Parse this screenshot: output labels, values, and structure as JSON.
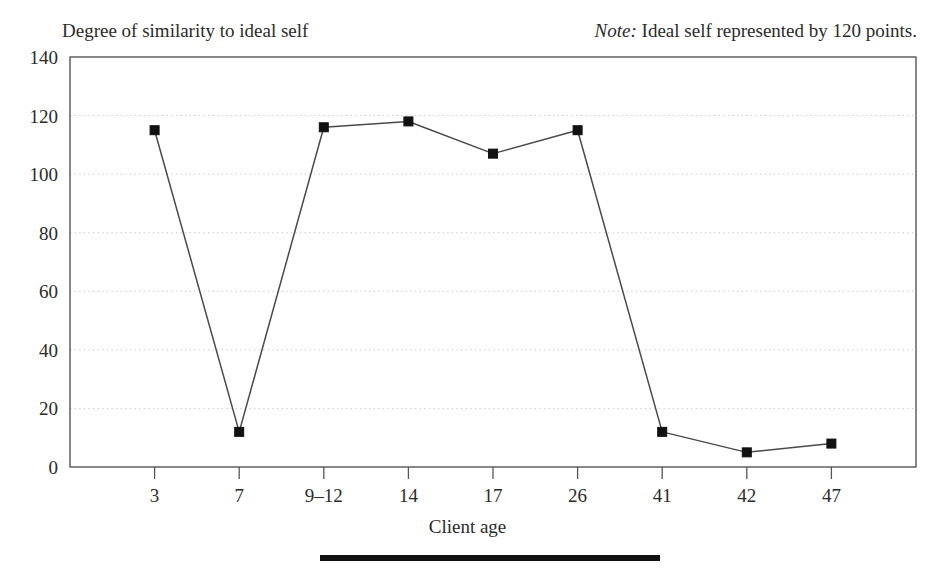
{
  "chart_data": {
    "type": "line",
    "title": "",
    "subtitle": "",
    "header_label": "Degree of similarity to ideal self",
    "note": {
      "label": "Note:",
      "text": "Ideal self represented by 120 points."
    },
    "xlabel": "Client age",
    "ylabel": "Degree of similarity to ideal self",
    "categories": [
      "3",
      "7",
      "9–12",
      "14",
      "17",
      "26",
      "41",
      "42",
      "47"
    ],
    "values": [
      115,
      12,
      116,
      118,
      107,
      115,
      12,
      5,
      8
    ],
    "series": [
      {
        "name": "Degree of similarity to ideal self",
        "values": [
          115,
          12,
          116,
          118,
          107,
          115,
          12,
          5,
          8
        ]
      }
    ],
    "ylim": [
      0,
      140
    ],
    "yticks": [
      0,
      20,
      40,
      60,
      80,
      100,
      120,
      140
    ],
    "ytick_labels": [
      "0",
      "20",
      "40",
      "60",
      "80",
      "100",
      "120",
      "140"
    ],
    "xtick_labels": [
      "3",
      "7",
      "9–12",
      "14",
      "17",
      "26",
      "41",
      "42",
      "47"
    ],
    "grid": "horizontal-dotted",
    "legend": "none",
    "marker": "filled-square",
    "line_color": "#4a4a4a",
    "marker_color": "#111111",
    "grid_color": "#c9c9c9",
    "axis_color": "#555555"
  }
}
